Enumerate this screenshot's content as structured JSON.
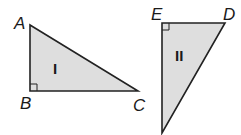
{
  "diagram": {
    "fill_color": "#dedede",
    "stroke_color": "#222222",
    "triangles": [
      {
        "name": "I",
        "right_angle_at": "B",
        "vertices": {
          "A": {
            "label": "A",
            "x": 30,
            "y": 25
          },
          "B": {
            "label": "B",
            "x": 30,
            "y": 91
          },
          "C": {
            "label": "C",
            "x": 138,
            "y": 91
          }
        },
        "numeral": "I"
      },
      {
        "name": "II",
        "right_angle_at": "E",
        "vertices": {
          "E": {
            "label": "E",
            "x": 162,
            "y": 23
          },
          "D": {
            "label": "D",
            "x": 225,
            "y": 23
          },
          "F": {
            "label": "",
            "x": 162,
            "y": 133
          }
        },
        "numeral": "II"
      }
    ]
  }
}
